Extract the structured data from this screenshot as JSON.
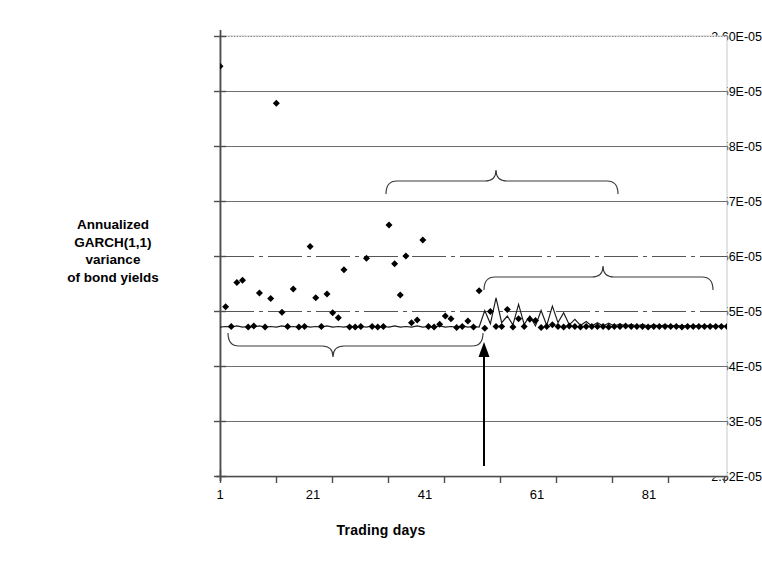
{
  "chart_data": {
    "type": "scatter",
    "title": "",
    "xlabel": "Trading days",
    "ylabel": "Annualized GARCH(1,1) variance of bond yields",
    "ylabel_lines": [
      "Annualized",
      "GARCH(1,1)",
      "variance",
      "of bond yields"
    ],
    "xlim": [
      1,
      91
    ],
    "ylim": [
      2.52e-05,
      2.6e-05
    ],
    "grid": true,
    "legend": "none",
    "ytick_labels": [
      "2.60E-05",
      "2.59E-05",
      "2.58E-05",
      "2.57E-05",
      "2.56E-05",
      "2.55E-05",
      "2.54E-05",
      "2.53E-05",
      "2.52E-05"
    ],
    "ytick_values": [
      2.6e-05,
      2.59e-05,
      2.58e-05,
      2.57e-05,
      2.56e-05,
      2.55e-05,
      2.54e-05,
      2.53e-05,
      2.52e-05
    ],
    "xtick_labels": [
      "1",
      "21",
      "41",
      "61",
      "81"
    ],
    "xtick_values": [
      1,
      21,
      41,
      61,
      81
    ],
    "xminor_ticks": [
      11,
      31,
      51,
      71,
      91
    ],
    "event_day": 47,
    "series": [
      {
        "name": "GARCH(1,1) variance scatter",
        "marker": "diamond",
        "x": [
          1,
          2,
          3,
          4,
          5,
          6,
          7,
          8,
          9,
          10,
          11,
          12,
          13,
          14,
          15,
          16,
          17,
          18,
          19,
          20,
          21,
          22,
          23,
          24,
          25,
          26,
          27,
          28,
          29,
          30,
          31,
          32,
          33,
          34,
          35,
          36,
          37,
          38,
          39,
          40,
          41,
          42,
          43,
          44,
          45,
          46,
          47,
          48,
          49,
          50,
          51,
          52,
          53,
          54,
          55,
          56,
          57,
          58,
          59,
          60,
          61,
          62,
          63,
          64,
          65,
          66,
          67,
          68,
          69,
          70,
          71,
          72,
          73,
          74,
          75,
          76,
          77,
          78,
          79,
          80,
          81,
          82,
          83,
          84,
          85,
          86,
          87,
          88,
          89,
          90,
          91
        ],
        "y": [
          2.5945e-05,
          2.5509e-05,
          2.5473e-05,
          2.5553e-05,
          2.5557e-05,
          2.5472e-05,
          2.5474e-05,
          2.5534e-05,
          2.5472e-05,
          2.5524e-05,
          2.5878e-05,
          2.5499e-05,
          2.5473e-05,
          2.5541e-05,
          2.5472e-05,
          2.5473e-05,
          2.5618e-05,
          2.5525e-05,
          2.5473e-05,
          2.5532e-05,
          2.5498e-05,
          2.5489e-05,
          2.5576e-05,
          2.5472e-05,
          2.5472e-05,
          2.5473e-05,
          2.5597e-05,
          2.5473e-05,
          2.5472e-05,
          2.5473e-05,
          2.5657e-05,
          2.5587e-05,
          2.553e-05,
          2.5601e-05,
          2.548e-05,
          2.5485e-05,
          2.563e-05,
          2.5473e-05,
          2.5472e-05,
          2.5477e-05,
          2.5492e-05,
          2.5487e-05,
          2.5471e-05,
          2.5473e-05,
          2.5483e-05,
          2.5472e-05,
          2.5538e-05,
          2.547e-05,
          2.55e-05,
          2.5473e-05,
          2.5473e-05,
          2.5504e-05,
          2.5472e-05,
          2.5487e-05,
          2.5473e-05,
          2.5486e-05,
          2.5484e-05,
          2.5471e-05,
          2.5473e-05,
          2.5476e-05,
          2.5473e-05,
          2.5472e-05,
          2.5474e-05,
          2.5473e-05,
          2.5472e-05,
          2.5473e-05,
          2.5473e-05,
          2.5473e-05,
          2.5473e-05,
          2.5472e-05,
          2.5473e-05,
          2.5473e-05,
          2.5474e-05,
          2.5473e-05,
          2.5473e-05,
          2.5473e-05,
          2.5472e-05,
          2.5473e-05,
          2.5473e-05,
          2.5473e-05,
          2.5473e-05,
          2.5473e-05,
          2.5472e-05,
          2.5473e-05,
          2.5473e-05,
          2.5473e-05,
          2.5473e-05,
          2.5473e-05,
          2.5473e-05,
          2.5473e-05,
          2.5473e-05
        ]
      },
      {
        "name": "fitted variance line",
        "marker": "none",
        "x": [
          1,
          2,
          3,
          4,
          5,
          6,
          7,
          8,
          9,
          10,
          11,
          12,
          13,
          14,
          15,
          16,
          17,
          18,
          19,
          20,
          21,
          22,
          23,
          24,
          25,
          26,
          27,
          28,
          29,
          30,
          31,
          32,
          33,
          34,
          35,
          36,
          37,
          38,
          39,
          40,
          41,
          42,
          43,
          44,
          45,
          46,
          47,
          48,
          49,
          50,
          51,
          52,
          53,
          54,
          55,
          56,
          57,
          58,
          59,
          60,
          61,
          62,
          63,
          64,
          65,
          66,
          67,
          68,
          69,
          70,
          71,
          72,
          73,
          74,
          75,
          76,
          77,
          78,
          79,
          80,
          81,
          82,
          83,
          84,
          85,
          86,
          87,
          88,
          89,
          90,
          91
        ],
        "y": [
          2.5472e-05,
          2.5473e-05,
          2.5472e-05,
          2.5474e-05,
          2.5472e-05,
          2.5473e-05,
          2.5472e-05,
          2.5474e-05,
          2.5472e-05,
          2.5473e-05,
          2.5472e-05,
          2.5474e-05,
          2.5472e-05,
          2.5473e-05,
          2.5472e-05,
          2.5474e-05,
          2.5472e-05,
          2.5473e-05,
          2.5472e-05,
          2.5474e-05,
          2.5472e-05,
          2.5473e-05,
          2.5472e-05,
          2.5474e-05,
          2.5472e-05,
          2.5473e-05,
          2.5472e-05,
          2.5474e-05,
          2.5472e-05,
          2.5473e-05,
          2.5472e-05,
          2.5474e-05,
          2.5472e-05,
          2.5473e-05,
          2.5472e-05,
          2.5474e-05,
          2.5472e-05,
          2.5473e-05,
          2.5472e-05,
          2.5474e-05,
          2.5472e-05,
          2.5473e-05,
          2.5472e-05,
          2.5474e-05,
          2.5472e-05,
          2.5473e-05,
          2.5472e-05,
          2.5502e-05,
          2.5478e-05,
          2.5525e-05,
          2.548e-05,
          2.5492e-05,
          2.5476e-05,
          2.5513e-05,
          2.5477e-05,
          2.5492e-05,
          2.5474e-05,
          2.5502e-05,
          2.5475e-05,
          2.551e-05,
          2.548e-05,
          2.5498e-05,
          2.5476e-05,
          2.5486e-05,
          2.5475e-05,
          2.5482e-05,
          2.5474e-05,
          2.548e-05,
          2.5474e-05,
          2.5479e-05,
          2.5474e-05,
          2.5478e-05,
          2.5474e-05,
          2.5477e-05,
          2.5474e-05,
          2.5477e-05,
          2.5474e-05,
          2.5476e-05,
          2.5474e-05,
          2.5476e-05,
          2.5474e-05,
          2.5475e-05,
          2.5474e-05,
          2.5475e-05,
          2.5474e-05,
          2.5475e-05,
          2.5474e-05,
          2.5475e-05,
          2.5474e-05,
          2.5474e-05,
          2.5474e-05
        ]
      }
    ],
    "annotations": [
      {
        "id": "mid-period",
        "label": "Mid-period sample",
        "brace": "down",
        "x_start": 31,
        "x_end": 69
      },
      {
        "id": "post-event",
        "label": "Post-event sample",
        "brace": "down",
        "x_start": 47,
        "x_end": 80
      },
      {
        "id": "pre-event",
        "label": "Pre-event sample",
        "brace": "up",
        "x_start": 2,
        "x_end": 47
      },
      {
        "id": "event",
        "label": "Re-denomination of the\nRussian ruble",
        "marker": "arrow-up",
        "x": 47
      }
    ]
  },
  "labels": {
    "ytitle_l1": "Annualized",
    "ytitle_l2": "GARCH(1,1)",
    "ytitle_l3": "variance",
    "ytitle_l4": "of bond yields",
    "xtitle": "Trading days",
    "mid_period": "Mid-period sample",
    "post_event": "Post-event sample",
    "pre_event": "Pre-event  sample",
    "event_l1": "Re-denomination of the",
    "event_l2": "Russian ruble"
  },
  "yticks": [
    {
      "label": "2.60E-05"
    },
    {
      "label": "2.59E-05"
    },
    {
      "label": "2.58E-05"
    },
    {
      "label": "2.57E-05"
    },
    {
      "label": "2.56E-05"
    },
    {
      "label": "2.55E-05"
    },
    {
      "label": "2.54E-05"
    },
    {
      "label": "2.53E-05"
    },
    {
      "label": "2.52E-05"
    }
  ],
  "xticks": [
    {
      "label": "1"
    },
    {
      "label": "21"
    },
    {
      "label": "41"
    },
    {
      "label": "61"
    },
    {
      "label": "81"
    }
  ],
  "colors": {
    "marker": "#000000",
    "grid": "#808080",
    "axis": "#595959",
    "text": "#000000",
    "plot_border": "#bfbfbf"
  }
}
